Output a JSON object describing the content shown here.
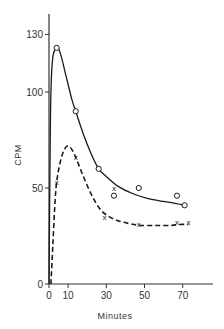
{
  "chart_data": {
    "type": "line",
    "title": "",
    "xlabel": "Minutes",
    "ylabel": "CPM",
    "xlim": [
      0,
      85
    ],
    "ylim": [
      0,
      140
    ],
    "xticks": [
      0,
      10,
      30,
      50,
      70
    ],
    "xtick_labels": [
      "0",
      "10",
      "30",
      "50",
      "70"
    ],
    "yticks": [
      0,
      50,
      100,
      130
    ],
    "ytick_labels": [
      "0",
      "50",
      "100",
      "130"
    ],
    "grid": false,
    "legend": null,
    "series": [
      {
        "name": "circles (solid curve)",
        "marker": "o",
        "line_style": "solid",
        "points": [
          {
            "x": 4,
            "y": 123
          },
          {
            "x": 14,
            "y": 90
          },
          {
            "x": 26,
            "y": 60
          },
          {
            "x": 34,
            "y": 46
          },
          {
            "x": 47,
            "y": 50
          },
          {
            "x": 67,
            "y": 46
          },
          {
            "x": 71,
            "y": 41
          }
        ],
        "curve": [
          [
            0,
            0
          ],
          [
            0.5,
            60
          ],
          [
            1,
            100
          ],
          [
            2,
            118
          ],
          [
            4,
            123
          ],
          [
            6,
            120
          ],
          [
            9,
            108
          ],
          [
            12,
            96
          ],
          [
            14,
            90
          ],
          [
            18,
            78
          ],
          [
            22,
            68
          ],
          [
            26,
            60
          ],
          [
            30,
            56
          ],
          [
            36,
            51
          ],
          [
            44,
            47
          ],
          [
            52,
            44.5
          ],
          [
            60,
            43
          ],
          [
            66,
            42
          ],
          [
            71,
            41
          ]
        ]
      },
      {
        "name": "crosses (dashed curve)",
        "marker": "x",
        "line_style": "dashed",
        "points": [
          {
            "x": 4,
            "y": 53
          },
          {
            "x": 14,
            "y": 66
          },
          {
            "x": 29,
            "y": 35
          },
          {
            "x": 34,
            "y": 50
          },
          {
            "x": 47,
            "y": 31
          },
          {
            "x": 67,
            "y": 32
          },
          {
            "x": 73,
            "y": 32
          }
        ],
        "curve": [
          [
            1,
            0
          ],
          [
            2,
            20
          ],
          [
            3,
            40
          ],
          [
            4,
            53
          ],
          [
            6,
            64
          ],
          [
            8,
            70
          ],
          [
            10,
            72
          ],
          [
            12,
            70
          ],
          [
            14,
            66
          ],
          [
            18,
            56
          ],
          [
            22,
            47
          ],
          [
            26,
            40
          ],
          [
            30,
            36
          ],
          [
            36,
            33
          ],
          [
            42,
            31.5
          ],
          [
            48,
            30.5
          ],
          [
            56,
            30.5
          ],
          [
            64,
            30.5
          ],
          [
            68,
            31
          ],
          [
            73,
            31
          ]
        ]
      }
    ]
  }
}
